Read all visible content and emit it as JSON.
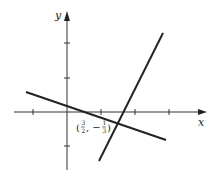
{
  "figure": {
    "axes": {
      "x_label": "x",
      "y_label": "y",
      "x_ticks": [
        -1,
        1,
        2,
        3
      ],
      "y_ticks": [
        2,
        1,
        -1
      ]
    },
    "lines": [
      {
        "name": "shallow-line",
        "slope_sign": "negative",
        "color": "#222222"
      },
      {
        "name": "steep-line",
        "slope_sign": "positive",
        "color": "#222222"
      }
    ],
    "intersection": {
      "label_open": "(",
      "x_num": "3",
      "x_den": "2",
      "separator": ", −",
      "y_num": "1",
      "y_den": "3",
      "label_close": ")",
      "full_label": "(3/2, −1/3)"
    }
  }
}
